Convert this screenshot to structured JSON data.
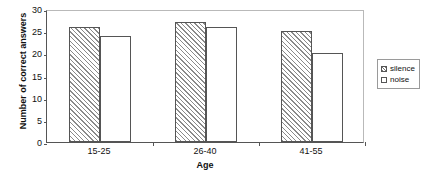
{
  "chart_data": {
    "type": "bar",
    "title": "",
    "subtitle": "",
    "xlabel": "Age",
    "ylabel": "Number of correct answers",
    "categories": [
      "15-25",
      "26-40",
      "41-55"
    ],
    "series": [
      {
        "name": "silence",
        "values": [
          26,
          27,
          25
        ],
        "fill": "diagonal-hatch",
        "color": "#8a8a8a"
      },
      {
        "name": "noise",
        "values": [
          24,
          26,
          20
        ],
        "fill": "solid-white",
        "color": "#ffffff"
      }
    ],
    "ylim": [
      0,
      30
    ],
    "ytick_step": 5,
    "yticks": [
      0,
      5,
      10,
      15,
      20,
      25,
      30
    ],
    "ytick_labels": [
      "0",
      "5",
      "10",
      "15",
      "20",
      "25",
      "30"
    ],
    "grid": false,
    "legend_position": "right",
    "legend_entries": [
      "silence",
      "noise"
    ],
    "annotations": [],
    "frame_color": "#b9b9b9",
    "axis_color": "#555555"
  }
}
